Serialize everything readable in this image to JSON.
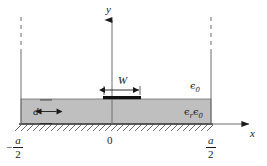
{
  "figure": {
    "type": "microstrip-cross-section",
    "labels": {
      "y_axis": "y",
      "x_axis": "x",
      "origin": "0",
      "strip_width": "W",
      "substrate_thickness": "d",
      "air_permittivity": "ϵ0",
      "air_permittivity_base": "ϵ",
      "air_permittivity_sub": "0",
      "substrate_permittivity_base1": "ϵ",
      "substrate_permittivity_sub1": "r",
      "substrate_permittivity_base2": "ϵ",
      "substrate_permittivity_sub2": "0",
      "left_wall_minus": "−",
      "left_wall_num": "a",
      "left_wall_den": "2",
      "right_wall_num": "a",
      "right_wall_den": "2"
    },
    "colors": {
      "substrate_fill": "#bfbfbf",
      "line": "#3a3a3a",
      "strip": "#111111",
      "hatch": "#4a4a4a",
      "background": "#ffffff"
    },
    "geometry": {
      "left_wall_x": 21,
      "right_wall_x": 211,
      "ground_y": 124,
      "substrate_top_y": 99,
      "origin_x": 112,
      "y_axis_top_y": 17,
      "x_axis_end_x": 252,
      "strip_left_x": 103,
      "strip_right_x": 141,
      "strip_y": 97
    }
  }
}
